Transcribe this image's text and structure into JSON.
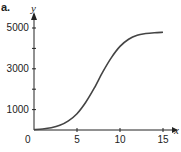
{
  "figure": {
    "part_label": "a.",
    "x_axis_name": "x",
    "y_axis_name": "y",
    "axis_color": "#222222",
    "curve_color": "#444444"
  },
  "chart_data": {
    "type": "line",
    "title": "",
    "xlabel": "x",
    "ylabel": "y",
    "xlim": [
      0,
      16
    ],
    "ylim": [
      0,
      5500
    ],
    "x_ticks": [
      5,
      10,
      15
    ],
    "x_tick_labels": [
      "0",
      "5",
      "10",
      "15"
    ],
    "y_ticks": [
      1000,
      2000,
      3000,
      4000,
      5000
    ],
    "y_tick_labels": [
      "1000",
      "3000",
      "5000"
    ],
    "grid": false,
    "legend": null,
    "series": [
      {
        "name": "logistic curve",
        "x": [
          0,
          1,
          2,
          3,
          4,
          5,
          6,
          7,
          8,
          9,
          10,
          11,
          12,
          13,
          14,
          15
        ],
        "y": [
          20,
          50,
          110,
          230,
          450,
          800,
          1350,
          2050,
          2850,
          3550,
          4100,
          4450,
          4650,
          4730,
          4770,
          4790
        ]
      }
    ]
  }
}
